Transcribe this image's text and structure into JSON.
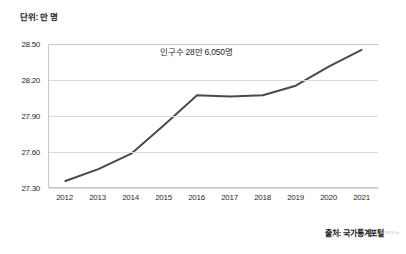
{
  "unit_label": "단위: 만 명",
  "annotation": "인구수 28만 6,050명",
  "source": "출처: 국가통계포털",
  "watermark": "KOSIS.kr",
  "colors": {
    "line": "#4a4a4a",
    "grid": "#dcdcdc",
    "axis": "#c9c9c9",
    "text": "#2a2a2a",
    "background": "#ffffff"
  },
  "chart_data": {
    "type": "line",
    "title": "",
    "subtitle": "",
    "xlabel": "",
    "ylabel": "단위: 만 명",
    "categories": [
      "2012",
      "2013",
      "2014",
      "2015",
      "2016",
      "2017",
      "2018",
      "2019",
      "2020",
      "2021"
    ],
    "values": [
      27.35,
      27.45,
      27.58,
      27.82,
      28.07,
      28.06,
      28.07,
      28.15,
      28.31,
      28.45
    ],
    "ylim": [
      27.0,
      28.5
    ],
    "ytick_labels": [
      "28.50",
      "28.20",
      "27.90",
      "27.60",
      "27.30"
    ],
    "ytick_values": [
      28.5,
      28.2,
      27.9,
      27.6,
      27.3
    ],
    "grid": true,
    "legend": "none",
    "annotations": [
      {
        "text": "인구수 28만 6,050명",
        "x": "2016",
        "y": 28.4
      }
    ]
  }
}
